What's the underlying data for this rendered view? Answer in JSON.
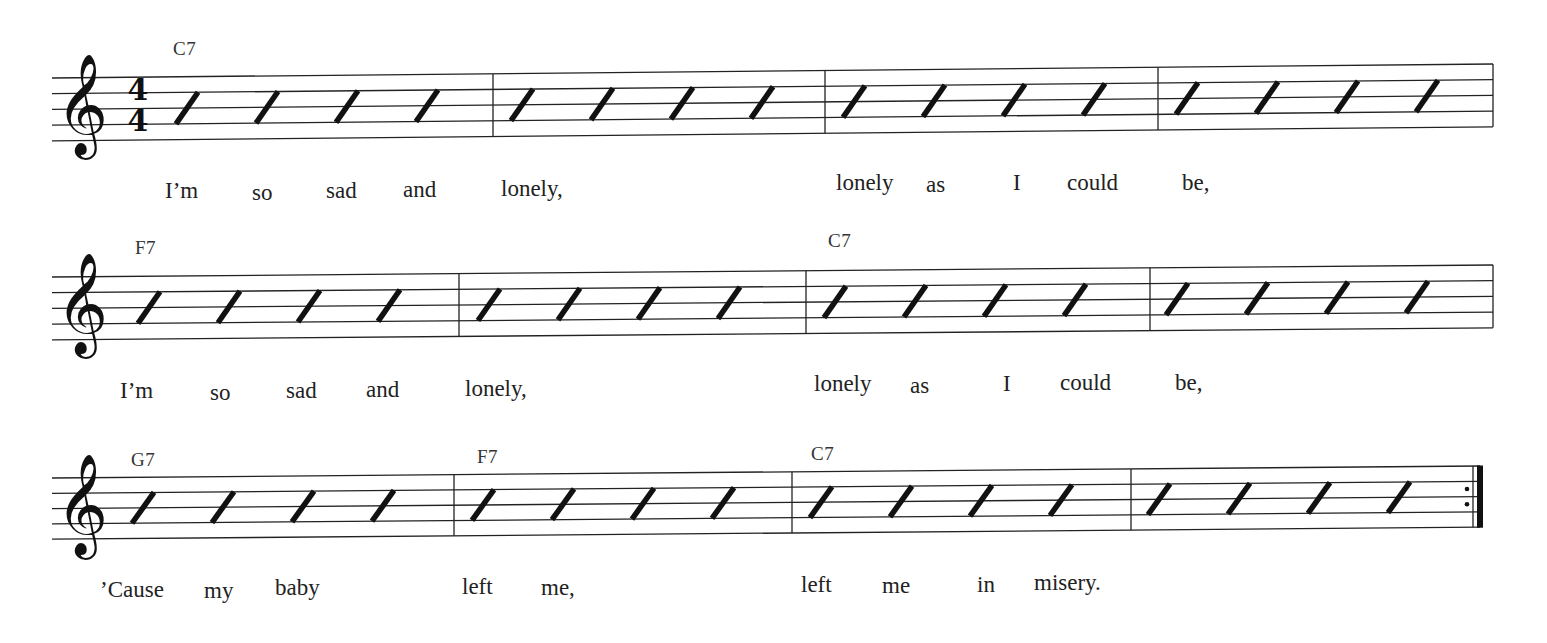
{
  "title": "",
  "music": {
    "time_signature": {
      "top": "4",
      "bottom": "4"
    },
    "clef": "treble-clef",
    "clef_glyph": "𝄞",
    "systems": [
      {
        "staff": {
          "x_left": 52,
          "x_right": 1493,
          "top_left": 78,
          "top_right": 64,
          "spacing": 15.7
        },
        "barlines_x": [
          493,
          825,
          1158,
          1493
        ],
        "final_barline": false,
        "has_time_signature": true,
        "slash_start_x": [
          176,
          256,
          336,
          416,
          511,
          591,
          671,
          751,
          843,
          923,
          1003,
          1083,
          1176,
          1256,
          1336,
          1416
        ],
        "chords": [
          {
            "label": "C7",
            "x": 173,
            "y": 38
          }
        ],
        "lyrics": [
          {
            "text": "I’m",
            "x": 165,
            "y": 178
          },
          {
            "text": "so",
            "x": 252,
            "y": 180
          },
          {
            "text": "sad",
            "x": 326,
            "y": 178
          },
          {
            "text": "and",
            "x": 403,
            "y": 177
          },
          {
            "text": "lonely,",
            "x": 501,
            "y": 176
          },
          {
            "text": "lonely",
            "x": 836,
            "y": 170
          },
          {
            "text": "as",
            "x": 926,
            "y": 172
          },
          {
            "text": "I",
            "x": 1013,
            "y": 170
          },
          {
            "text": "could",
            "x": 1067,
            "y": 170
          },
          {
            "text": "be,",
            "x": 1182,
            "y": 170
          }
        ]
      },
      {
        "staff": {
          "x_left": 52,
          "x_right": 1493,
          "top_left": 277,
          "top_right": 265,
          "spacing": 15.7
        },
        "barlines_x": [
          459,
          806,
          1150,
          1493
        ],
        "final_barline": false,
        "has_time_signature": false,
        "slash_start_x": [
          138,
          218,
          298,
          378,
          478,
          558,
          638,
          718,
          824,
          904,
          984,
          1064,
          1166,
          1246,
          1326,
          1406
        ],
        "chords": [
          {
            "label": "F7",
            "x": 135,
            "y": 237
          },
          {
            "label": "C7",
            "x": 828,
            "y": 230
          }
        ],
        "lyrics": [
          {
            "text": "I’m",
            "x": 120,
            "y": 378
          },
          {
            "text": "so",
            "x": 210,
            "y": 380
          },
          {
            "text": "sad",
            "x": 286,
            "y": 378
          },
          {
            "text": "and",
            "x": 366,
            "y": 377
          },
          {
            "text": "lonely,",
            "x": 465,
            "y": 376
          },
          {
            "text": "lonely",
            "x": 814,
            "y": 371
          },
          {
            "text": "as",
            "x": 910,
            "y": 373
          },
          {
            "text": "I",
            "x": 1003,
            "y": 371
          },
          {
            "text": "could",
            "x": 1060,
            "y": 370
          },
          {
            "text": "be,",
            "x": 1175,
            "y": 370
          }
        ]
      },
      {
        "staff": {
          "x_left": 52,
          "x_right": 1480,
          "top_left": 478,
          "top_right": 466,
          "spacing": 15.3
        },
        "barlines_x": [
          454,
          792,
          1131,
          1480
        ],
        "final_barline": true,
        "repeat_dots": true,
        "has_time_signature": false,
        "slash_start_x": [
          132,
          212,
          292,
          372,
          472,
          552,
          632,
          712,
          810,
          890,
          970,
          1050,
          1148,
          1228,
          1308,
          1388
        ],
        "chords": [
          {
            "label": "G7",
            "x": 131,
            "y": 449
          },
          {
            "label": "F7",
            "x": 477,
            "y": 446
          },
          {
            "label": "C7",
            "x": 811,
            "y": 443
          }
        ],
        "lyrics": [
          {
            "text": "’Cause",
            "x": 100,
            "y": 577
          },
          {
            "text": "my",
            "x": 204,
            "y": 578
          },
          {
            "text": "baby",
            "x": 275,
            "y": 575
          },
          {
            "text": "left",
            "x": 462,
            "y": 574
          },
          {
            "text": "me,",
            "x": 541,
            "y": 575
          },
          {
            "text": "left",
            "x": 801,
            "y": 572
          },
          {
            "text": "me",
            "x": 882,
            "y": 573
          },
          {
            "text": "in",
            "x": 977,
            "y": 572
          },
          {
            "text": "misery.",
            "x": 1034,
            "y": 570
          }
        ]
      }
    ]
  },
  "colors": {
    "ink": "#111111",
    "paper": "#ffffff"
  }
}
